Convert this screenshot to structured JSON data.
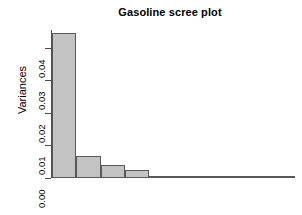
{
  "chart_data": {
    "type": "bar",
    "title": "Gasoline scree plot",
    "xlabel": "",
    "ylabel": "Variances",
    "categories": [
      "1",
      "2",
      "3",
      "4",
      "5",
      "6",
      "7",
      "8",
      "9",
      "10"
    ],
    "values": [
      0.0445,
      0.0068,
      0.004,
      0.0024,
      0.00058,
      0.00042,
      0.00022,
      0.00014,
      0.0001,
      7e-05
    ],
    "ylim": [
      0.0,
      0.0455
    ],
    "ytick_labels": [
      "0.00",
      "0.01",
      "0.02",
      "0.03",
      "0.04"
    ],
    "ytick_values": [
      0.0,
      0.01,
      0.02,
      0.03,
      0.04
    ],
    "grid": false,
    "legend": null,
    "bar_fill_color": "#c3c3c3",
    "bar_border_color": "#585858",
    "axis_color": "#4d4d4d",
    "background_color": "#ffffff"
  }
}
